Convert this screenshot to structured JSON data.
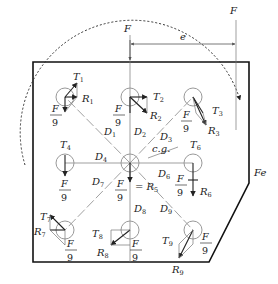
{
  "figure": {
    "type": "eccentric bolt group free-body diagram",
    "load": {
      "label": "F",
      "eccentricity_label": "e",
      "moment_label": "Fe"
    },
    "centroid_label": "c.g.",
    "direct_shear_label": {
      "num": "F",
      "den": "9"
    },
    "center_equation": "= R",
    "center_equation_sub": "5",
    "bolts": [
      {
        "id": 1,
        "T": "T",
        "R": "R",
        "D": "D",
        "sub": "1"
      },
      {
        "id": 2,
        "T": "T",
        "R": "R",
        "D": "D",
        "sub": "2"
      },
      {
        "id": 3,
        "T": "T",
        "R": "R",
        "D": "D",
        "sub": "3"
      },
      {
        "id": 4,
        "T": "T",
        "D": "D",
        "sub": "4"
      },
      {
        "id": 5,
        "R": "R",
        "sub": "5"
      },
      {
        "id": 6,
        "T": "T",
        "R": "R",
        "D": "D",
        "sub": "6"
      },
      {
        "id": 7,
        "T": "T",
        "R": "R",
        "D": "D",
        "sub": "7"
      },
      {
        "id": 8,
        "T": "T",
        "R": "R",
        "D": "D",
        "sub": "8"
      },
      {
        "id": 9,
        "T": "T",
        "R": "R",
        "D": "D",
        "sub": "9"
      }
    ]
  },
  "colors": {
    "ink": "#222222",
    "construction": "#777777",
    "bolt_circle": "#999999"
  }
}
